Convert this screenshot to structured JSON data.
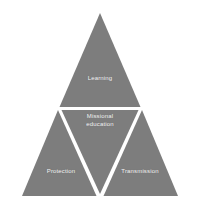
{
  "diagram": {
    "type": "subdivided-triangle",
    "title": "",
    "background_color": "#ffffff",
    "fill_color": "#7d7d7d",
    "divider_color": "#ffffff",
    "text_color": "#f2f2f2",
    "geometry": {
      "apex": [
        100,
        13
      ],
      "bottom_left": [
        22,
        196
      ],
      "bottom_right": [
        178,
        196
      ],
      "divider_width": 2
    },
    "segments": [
      {
        "id": "top",
        "label": "Learning",
        "label_x": 100,
        "label_y": 79,
        "orientation": "upright"
      },
      {
        "id": "center",
        "label": "Missional\neducation",
        "label_x": 100,
        "label_y": 120,
        "orientation": "inverted"
      },
      {
        "id": "bottom-left",
        "label": "Protection",
        "label_x": 61,
        "label_y": 172,
        "orientation": "upright"
      },
      {
        "id": "bottom-right",
        "label": "Transmission",
        "label_x": 140,
        "label_y": 172,
        "orientation": "upright"
      }
    ]
  }
}
